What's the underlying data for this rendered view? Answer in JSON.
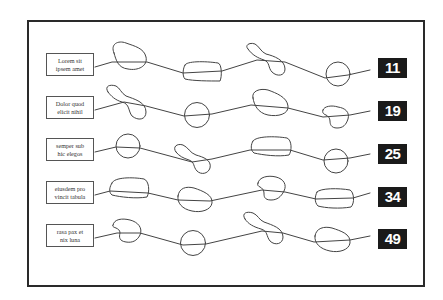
{
  "diagram": {
    "rows": [
      {
        "label_line1": "Lorem sit",
        "label_line2": "ipsem amet",
        "number": "11",
        "shapes": [
          "blob",
          "rounded-rect",
          "peanut",
          "circle"
        ]
      },
      {
        "label_line1": "Dolor quod",
        "label_line2": "elicit nihil",
        "number": "19",
        "shapes": [
          "peanut",
          "circle",
          "blob",
          "heart-blob"
        ]
      },
      {
        "label_line1": "semper sub",
        "label_line2": "hic elegos",
        "number": "25",
        "shapes": [
          "circle",
          "peanut",
          "rounded-rect",
          "circle"
        ]
      },
      {
        "label_line1": "eiusdem pro",
        "label_line2": "vincit tabula",
        "number": "34",
        "shapes": [
          "rounded-rect",
          "blob",
          "heart-blob",
          "rounded-rect"
        ]
      },
      {
        "label_line1": "rasa pax et",
        "label_line2": "nix luna",
        "number": "49",
        "shapes": [
          "heart-blob",
          "circle",
          "peanut",
          "blob"
        ]
      }
    ]
  },
  "colors": {
    "frame": "#2a2a2a",
    "stroke": "#444444",
    "badge_bg": "#1a1a1a",
    "badge_text": "#ffffff"
  }
}
